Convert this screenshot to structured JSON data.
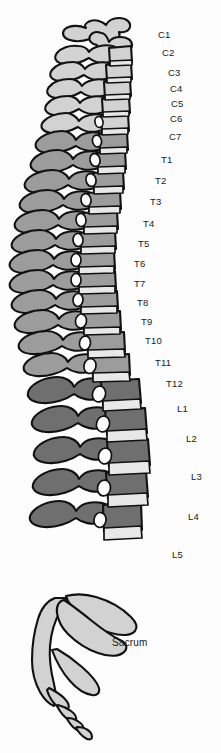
{
  "figure": {
    "background_color": "#fdfdfd",
    "outline_color": "#111111",
    "palette": {
      "cervical_fill": "#d2d2d2",
      "thoracic_fill": "#9c9c9c",
      "lumbar_fill": "#6f6f6f",
      "sacrum_fill": "#d2d2d2",
      "disc_fill": "#e8e8e8",
      "label_color": "#1a1a1a"
    },
    "regions": [
      {
        "name": "Cervical",
        "fill": "#d2d2d2",
        "count": 7
      },
      {
        "name": "Thoracic",
        "fill": "#9c9c9c",
        "count": 12
      },
      {
        "name": "Lumbar",
        "fill": "#6f6f6f",
        "count": 5
      },
      {
        "name": "Sacrum and coccyx",
        "fill": "#d2d2d2",
        "count": 1
      }
    ]
  },
  "labels": [
    {
      "text": "C1",
      "region": "cervical",
      "x": 158,
      "y": 30
    },
    {
      "text": "C2",
      "region": "cervical",
      "x": 162,
      "y": 48
    },
    {
      "text": "C3",
      "region": "cervical",
      "x": 168,
      "y": 68
    },
    {
      "text": "C4",
      "region": "cervical",
      "x": 170,
      "y": 84
    },
    {
      "text": "C5",
      "region": "cervical",
      "x": 171,
      "y": 99
    },
    {
      "text": "C6",
      "region": "cervical",
      "x": 170,
      "y": 114
    },
    {
      "text": "C7",
      "region": "cervical",
      "x": 169,
      "y": 132
    },
    {
      "text": "T1",
      "region": "thoracic",
      "x": 161,
      "y": 155
    },
    {
      "text": "T2",
      "region": "thoracic",
      "x": 155,
      "y": 176
    },
    {
      "text": "T3",
      "region": "thoracic",
      "x": 150,
      "y": 197
    },
    {
      "text": "T4",
      "region": "thoracic",
      "x": 143,
      "y": 219
    },
    {
      "text": "T5",
      "region": "thoracic",
      "x": 138,
      "y": 239
    },
    {
      "text": "T6",
      "region": "thoracic",
      "x": 134,
      "y": 259
    },
    {
      "text": "T7",
      "region": "thoracic",
      "x": 134,
      "y": 279
    },
    {
      "text": "T8",
      "region": "thoracic",
      "x": 137,
      "y": 298
    },
    {
      "text": "T9",
      "region": "thoracic",
      "x": 141,
      "y": 317
    },
    {
      "text": "T10",
      "region": "thoracic",
      "x": 145,
      "y": 336
    },
    {
      "text": "T11",
      "region": "thoracic",
      "x": 155,
      "y": 358
    },
    {
      "text": "T12",
      "region": "thoracic",
      "x": 166,
      "y": 379
    },
    {
      "text": "L1",
      "region": "lumbar",
      "x": 177,
      "y": 404
    },
    {
      "text": "L2",
      "region": "lumbar",
      "x": 186,
      "y": 434
    },
    {
      "text": "L3",
      "region": "lumbar",
      "x": 191,
      "y": 472
    },
    {
      "text": "L4",
      "region": "lumbar",
      "x": 188,
      "y": 512
    },
    {
      "text": "L5",
      "region": "lumbar",
      "x": 172,
      "y": 550
    },
    {
      "text": "Sacrum",
      "region": "sacrum",
      "x": 112,
      "y": 638
    }
  ]
}
